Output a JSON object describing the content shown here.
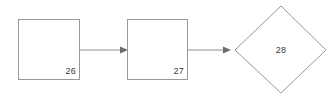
{
  "canvas": {
    "width": 331,
    "height": 97,
    "background": "#ffffff"
  },
  "style": {
    "shape_stroke": "#999999",
    "shape_fill": "#ffffff",
    "edge_stroke": "#8f8f8f",
    "arrowhead_fill": "#6e6e6e",
    "label_color": "#3a3a3a"
  },
  "diagram": {
    "title": "",
    "type": "flowchart",
    "nodes": [
      {
        "id": "node-26",
        "shape": "rectangle",
        "label": "26",
        "label_position": "bottom-right",
        "x": 18,
        "y": 19,
        "width": 62,
        "height": 61,
        "label_x": 76,
        "label_y": 74
      },
      {
        "id": "node-27",
        "shape": "rectangle",
        "label": "27",
        "label_position": "bottom-right",
        "x": 127,
        "y": 19,
        "width": 61,
        "height": 61,
        "label_x": 184,
        "label_y": 74
      },
      {
        "id": "node-28",
        "shape": "diamond",
        "label": "28",
        "label_position": "center",
        "cx": 281,
        "cy": 50,
        "rx": 45,
        "ry": 44,
        "points": "235,50 281,6 326,50 281,93",
        "label_x": 281,
        "label_y": 53
      }
    ],
    "edges": [
      {
        "id": "edge-26-27",
        "from": "node-26",
        "to": "node-27",
        "label": "",
        "direction": "right",
        "x1": 80,
        "y1": 50,
        "x2": 121,
        "y2": 50,
        "arrow_points": "120,46.5 128,50 120,53.5"
      },
      {
        "id": "edge-27-28",
        "from": "node-27",
        "to": "node-28",
        "label": "",
        "direction": "right",
        "x1": 188,
        "y1": 50,
        "x2": 224,
        "y2": 50,
        "arrow_points": "223,46.5 231,50 223,53.5"
      }
    ]
  }
}
